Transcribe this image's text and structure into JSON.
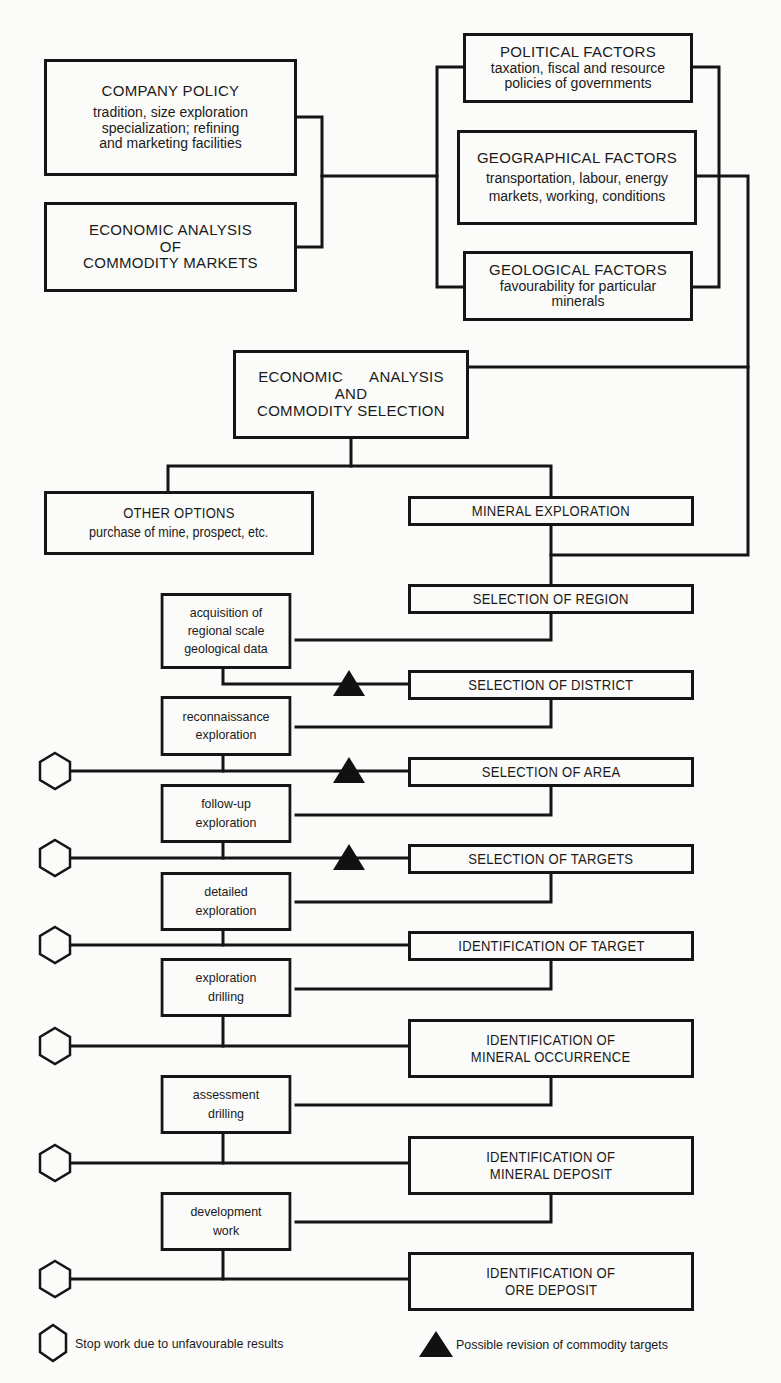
{
  "top_inputs": {
    "company_policy": {
      "title": "COMPANY POLICY",
      "lines": [
        "tradition, size exploration",
        "specialization; refining",
        "and marketing facilities"
      ]
    },
    "economic_analysis_markets": {
      "lines": [
        "ECONOMIC ANALYSIS",
        "OF",
        "COMMODITY MARKETS"
      ]
    }
  },
  "factors": {
    "political": {
      "title": "POLITICAL FACTORS",
      "lines": [
        "taxation, fiscal and resource",
        "policies of governments"
      ]
    },
    "geographical": {
      "title": "GEOGRAPHICAL FACTORS",
      "lines": [
        "transportation, labour, energy",
        "markets, working, conditions"
      ]
    },
    "geological": {
      "title": "GEOLOGICAL FACTORS",
      "lines": [
        "favourability for particular",
        "minerals"
      ]
    }
  },
  "commodity_selection": {
    "lines": [
      "ECONOMIC      ANALYSIS",
      "AND",
      "COMMODITY SELECTION"
    ]
  },
  "other_options": {
    "title": "OTHER OPTIONS",
    "subtitle": "purchase of mine, prospect, etc."
  },
  "mineral_exploration": {
    "title": "MINERAL EXPLORATION"
  },
  "milestones": [
    {
      "lines": [
        "SELECTION OF REGION"
      ]
    },
    {
      "lines": [
        "SELECTION OF DISTRICT"
      ]
    },
    {
      "lines": [
        "SELECTION OF AREA"
      ]
    },
    {
      "lines": [
        "SELECTION OF TARGETS"
      ]
    },
    {
      "lines": [
        "IDENTIFICATION OF TARGET"
      ]
    },
    {
      "lines": [
        "IDENTIFICATION OF",
        "MINERAL OCCURRENCE"
      ]
    },
    {
      "lines": [
        "IDENTIFICATION OF",
        "MINERAL DEPOSIT"
      ]
    },
    {
      "lines": [
        "IDENTIFICATION OF",
        "ORE DEPOSIT"
      ]
    }
  ],
  "activities": [
    {
      "lines": [
        "acquisition of",
        "regional scale",
        "geological data"
      ]
    },
    {
      "lines": [
        "reconnaissance",
        "exploration"
      ]
    },
    {
      "lines": [
        "follow-up",
        "exploration"
      ]
    },
    {
      "lines": [
        "detailed",
        "exploration"
      ]
    },
    {
      "lines": [
        "exploration",
        "drilling"
      ]
    },
    {
      "lines": [
        "assessment",
        "drilling"
      ]
    },
    {
      "lines": [
        "development",
        "work"
      ]
    }
  ],
  "legend": {
    "stop_symbol": "hexagon-icon",
    "stop_label": "Stop work due to unfavourable results",
    "revision_symbol": "triangle-icon",
    "revision_label": "Possible revision of commodity targets"
  },
  "colors": {
    "ink": "#151515",
    "paper": "#fbfbf9"
  }
}
